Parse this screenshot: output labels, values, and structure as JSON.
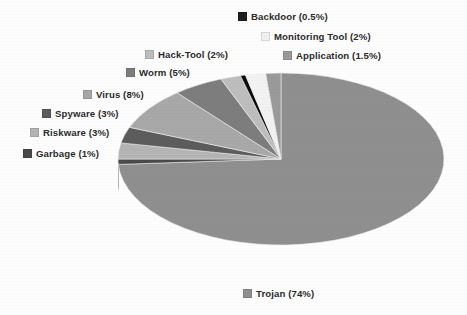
{
  "chart_data": {
    "type": "pie",
    "title": "",
    "subtitle": "",
    "xlabel": "",
    "ylabel": "",
    "legend_position": "around-pie",
    "grid": false,
    "three_d": true,
    "categories": [
      "Trojan",
      "Virus",
      "Worm",
      "Spyware",
      "Riskware",
      "Hack-Tool",
      "Monitoring Tool",
      "Application",
      "Garbage",
      "Backdoor"
    ],
    "values": [
      74,
      8,
      5,
      3,
      3,
      2,
      2,
      1.5,
      1,
      0.5
    ],
    "unit": "%",
    "slices": [
      {
        "label": "Trojan",
        "value": 74,
        "value_text": "74%",
        "annotation": "Trojan (74%)",
        "color": "#8f8f8f",
        "side_color": "#1b1b1b"
      },
      {
        "label": "Garbage",
        "value": 1,
        "value_text": "1%",
        "annotation": "Garbage (1%)",
        "color": "#4a4a4a",
        "side_color": "#1b1b1b"
      },
      {
        "label": "Riskware",
        "value": 3,
        "value_text": "3%",
        "annotation": "Riskware (3%)",
        "color": "#b4b4b4",
        "side_color": "#1b1b1b"
      },
      {
        "label": "Spyware",
        "value": 3,
        "value_text": "3%",
        "annotation": "Spyware (3%)",
        "color": "#5c5c5c",
        "side_color": "#1b1b1b"
      },
      {
        "label": "Virus",
        "value": 8,
        "value_text": "8%",
        "annotation": "Virus (8%)",
        "color": "#a8a8a8",
        "side_color": "#1b1b1b"
      },
      {
        "label": "Worm",
        "value": 5,
        "value_text": "5%",
        "annotation": "Worm (5%)",
        "color": "#7d7d7d",
        "side_color": "#1b1b1b"
      },
      {
        "label": "Hack-Tool",
        "value": 2,
        "value_text": "2%",
        "annotation": "Hack-Tool (2%)",
        "color": "#bdbdbd",
        "side_color": "#1b1b1b"
      },
      {
        "label": "Backdoor",
        "value": 0.5,
        "value_text": "0.5%",
        "annotation": "Backdoor (0.5%)",
        "color": "#0d0d0d",
        "side_color": "#0d0d0d"
      },
      {
        "label": "Monitoring Tool",
        "value": 2,
        "value_text": "2%",
        "annotation": "Monitoring Tool (2%)",
        "color": "#f2f2f2",
        "side_color": "#1b1b1b"
      },
      {
        "label": "Application",
        "value": 1.5,
        "value_text": "1.5%",
        "annotation": "Application (1.5%)",
        "color": "#9a9a9a",
        "side_color": "#1b1b1b"
      }
    ]
  },
  "labels": {
    "backdoor": {
      "text": "Backdoor (0.5%)",
      "swatch": "#1f1f1f"
    },
    "monitoring_tool": {
      "text": "Monitoring Tool (2%)",
      "swatch": "#f0f0f0"
    },
    "application": {
      "text": "Application (1.5%)",
      "swatch": "#9a9a9a"
    },
    "hack_tool": {
      "text": "Hack-Tool (2%)",
      "swatch": "#bdbdbd"
    },
    "worm": {
      "text": "Worm (5%)",
      "swatch": "#7d7d7d"
    },
    "virus": {
      "text": "Virus (8%)",
      "swatch": "#a8a8a8"
    },
    "spyware": {
      "text": "Spyware (3%)",
      "swatch": "#5c5c5c"
    },
    "riskware": {
      "text": "Riskware (3%)",
      "swatch": "#b4b4b4"
    },
    "garbage": {
      "text": "Garbage (1%)",
      "swatch": "#4a4a4a"
    },
    "trojan": {
      "text": "Trojan (74%)",
      "swatch": "#8f8f8f"
    }
  },
  "colors": {
    "background": "#fdfdfd",
    "text": "#2b2b2b",
    "pie_side_dark": "#1b1b1b"
  }
}
